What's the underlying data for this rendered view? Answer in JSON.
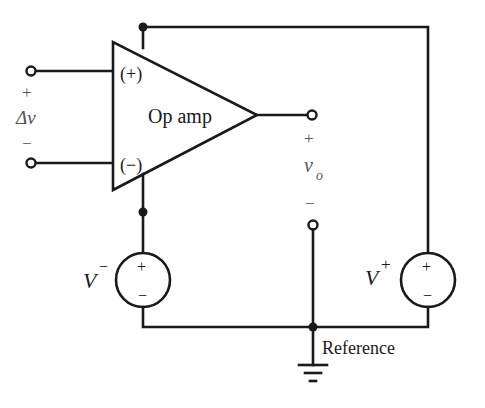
{
  "diagram": {
    "type": "circuit-schematic",
    "amplifier": {
      "label": "Op amp",
      "input_plus": "(+)",
      "input_minus": "(−)"
    },
    "input": {
      "plus_sign": "+",
      "symbol": "Δv",
      "minus_sign": "−"
    },
    "output": {
      "plus_sign": "+",
      "symbol": "v",
      "subscript": "o",
      "minus_sign": "−"
    },
    "sources": [
      {
        "name": "V",
        "superscript": "−",
        "plus": "+",
        "minus": "−"
      },
      {
        "name": "V",
        "superscript": "+",
        "plus": "+",
        "minus": "−"
      }
    ],
    "ground": {
      "label": "Reference"
    },
    "colors": {
      "ink": "#1a1a1a",
      "background": "#ffffff"
    }
  }
}
